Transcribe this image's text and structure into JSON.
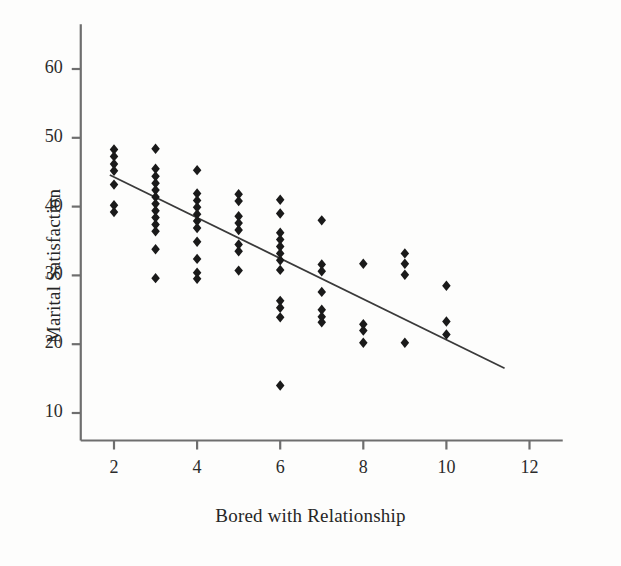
{
  "chart_data": {
    "type": "scatter",
    "title": "",
    "xlabel": "Bored with Relationship",
    "ylabel": "Marital Satisfaction",
    "xlim": [
      1.2,
      12.8
    ],
    "ylim": [
      6.0,
      66.5
    ],
    "xticks": [
      2,
      4,
      6,
      8,
      10,
      12
    ],
    "xtick_labels": [
      "2",
      "4",
      "6",
      "8",
      "10",
      "12"
    ],
    "yticks": [
      10,
      20,
      30,
      40,
      50,
      60
    ],
    "ytick_labels": [
      "10",
      "20",
      "30",
      "40",
      "50",
      "60"
    ],
    "grid": false,
    "legend": null,
    "marker": "diamond",
    "marker_color": "#1a1a1a",
    "marker_size": 8,
    "line_color": "#3a3a3a",
    "axis_color": "#6e6e6e",
    "background": "#fdfdfc",
    "points": [
      {
        "x": 2,
        "y": 48.3
      },
      {
        "x": 2,
        "y": 47.3
      },
      {
        "x": 2,
        "y": 46.2
      },
      {
        "x": 2,
        "y": 45.2
      },
      {
        "x": 2,
        "y": 43.2
      },
      {
        "x": 2,
        "y": 40.2
      },
      {
        "x": 2,
        "y": 39.2
      },
      {
        "x": 3,
        "y": 48.4
      },
      {
        "x": 3,
        "y": 45.5
      },
      {
        "x": 3,
        "y": 44.4
      },
      {
        "x": 3,
        "y": 43.4
      },
      {
        "x": 3,
        "y": 42.4
      },
      {
        "x": 3,
        "y": 41.4
      },
      {
        "x": 3,
        "y": 40.4
      },
      {
        "x": 3,
        "y": 39.4
      },
      {
        "x": 3,
        "y": 38.4
      },
      {
        "x": 3,
        "y": 37.4
      },
      {
        "x": 3,
        "y": 36.4
      },
      {
        "x": 3,
        "y": 33.8
      },
      {
        "x": 3,
        "y": 29.6
      },
      {
        "x": 4,
        "y": 45.3
      },
      {
        "x": 4,
        "y": 41.9
      },
      {
        "x": 4,
        "y": 40.9
      },
      {
        "x": 4,
        "y": 39.9
      },
      {
        "x": 4,
        "y": 38.9
      },
      {
        "x": 4,
        "y": 37.9
      },
      {
        "x": 4,
        "y": 36.9
      },
      {
        "x": 4,
        "y": 34.9
      },
      {
        "x": 4,
        "y": 32.4
      },
      {
        "x": 4,
        "y": 30.4
      },
      {
        "x": 4,
        "y": 29.5
      },
      {
        "x": 5,
        "y": 41.8
      },
      {
        "x": 5,
        "y": 40.8
      },
      {
        "x": 5,
        "y": 38.6
      },
      {
        "x": 5,
        "y": 37.6
      },
      {
        "x": 5,
        "y": 36.6
      },
      {
        "x": 5,
        "y": 34.5
      },
      {
        "x": 5,
        "y": 33.5
      },
      {
        "x": 5,
        "y": 30.7
      },
      {
        "x": 6,
        "y": 41.0
      },
      {
        "x": 6,
        "y": 39.0
      },
      {
        "x": 6,
        "y": 36.2
      },
      {
        "x": 6,
        "y": 35.2
      },
      {
        "x": 6,
        "y": 34.2
      },
      {
        "x": 6,
        "y": 33.2
      },
      {
        "x": 6,
        "y": 32.2
      },
      {
        "x": 6,
        "y": 30.8
      },
      {
        "x": 6,
        "y": 26.3
      },
      {
        "x": 6,
        "y": 25.3
      },
      {
        "x": 6,
        "y": 23.9
      },
      {
        "x": 6,
        "y": 14.0
      },
      {
        "x": 7,
        "y": 38.0
      },
      {
        "x": 7,
        "y": 31.6
      },
      {
        "x": 7,
        "y": 30.6
      },
      {
        "x": 7,
        "y": 27.6
      },
      {
        "x": 7,
        "y": 25.0
      },
      {
        "x": 7,
        "y": 24.0
      },
      {
        "x": 7,
        "y": 23.2
      },
      {
        "x": 8,
        "y": 31.7
      },
      {
        "x": 8,
        "y": 22.9
      },
      {
        "x": 8,
        "y": 22.0
      },
      {
        "x": 8,
        "y": 20.2
      },
      {
        "x": 9,
        "y": 33.2
      },
      {
        "x": 9,
        "y": 31.7
      },
      {
        "x": 9,
        "y": 30.1
      },
      {
        "x": 9,
        "y": 20.2
      },
      {
        "x": 10,
        "y": 28.5
      },
      {
        "x": 10,
        "y": 23.3
      },
      {
        "x": 10,
        "y": 21.4
      }
    ],
    "fit_line": {
      "x0": 1.9,
      "y0": 44.6,
      "x1": 11.4,
      "y1": 16.5,
      "description": "negative linear trend"
    }
  }
}
